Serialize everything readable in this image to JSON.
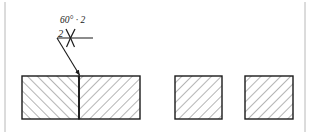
{
  "drawing": {
    "title": "Welded butt joint section view with V-groove weld symbol",
    "canvas": {
      "width": 311,
      "height": 134,
      "background": "#ffffff"
    },
    "frame": {
      "color": "#b8b8b8",
      "left_x": 5,
      "right_x": 305,
      "top_y": 2,
      "bottom_y": 132
    },
    "weld_symbol": {
      "groove_angle_label": "60° · 2",
      "root_dimension_label": "2",
      "symbol_glyph": "Y",
      "symbol_name": "v-groove-weld-symbol",
      "reference_line": {
        "x1": 57,
        "y1": 38,
        "x2": 93,
        "y2": 38
      },
      "leader_line": {
        "x1": 57,
        "y1": 38,
        "x2": 80,
        "y2": 75
      },
      "arrow_target": {
        "x": 80,
        "y": 76
      },
      "line_color": "#1a1a1a"
    },
    "parts": [
      {
        "name": "left-plate-section",
        "x": 22,
        "y": 76,
        "width": 57,
        "height": 43,
        "hatch_direction": "up-left",
        "hatch_angle_deg": 135,
        "hatch_spacing": 7,
        "outline_color": "#1a1a1a",
        "hatch_color": "#6b6b6b"
      },
      {
        "name": "right-plate-section",
        "x": 79,
        "y": 76,
        "width": 61,
        "height": 43,
        "hatch_direction": "up-right",
        "hatch_angle_deg": 45,
        "hatch_spacing": 7,
        "outline_color": "#1a1a1a",
        "hatch_color": "#6b6b6b"
      },
      {
        "name": "middle-plate-section",
        "x": 175,
        "y": 76,
        "width": 47,
        "height": 43,
        "hatch_direction": "up-right",
        "hatch_angle_deg": 45,
        "hatch_spacing": 7,
        "outline_color": "#1a1a1a",
        "hatch_color": "#6b6b6b"
      },
      {
        "name": "right-detached-plate-section",
        "x": 245,
        "y": 76,
        "width": 48,
        "height": 43,
        "hatch_direction": "up-right",
        "hatch_angle_deg": 45,
        "hatch_spacing": 7,
        "outline_color": "#1a1a1a",
        "hatch_color": "#6b6b6b"
      }
    ],
    "joint_line": {
      "x": 79,
      "y1": 76,
      "y2": 119,
      "color": "#1a1a1a"
    }
  }
}
